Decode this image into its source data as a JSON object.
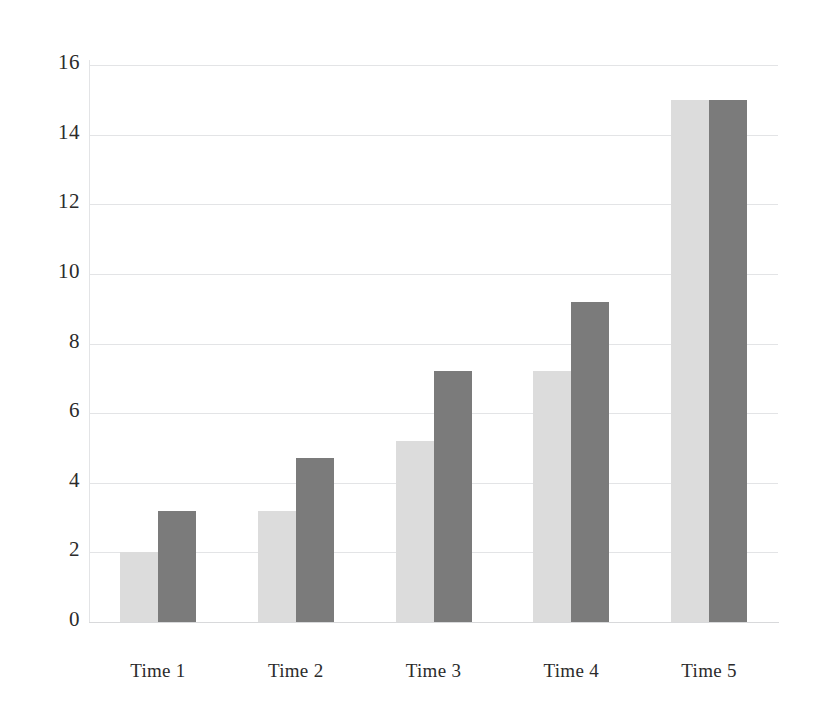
{
  "chart_data": {
    "type": "bar",
    "title": "",
    "subtitle": "",
    "xlabel": "",
    "ylabel": "",
    "categories": [
      "Time 1",
      "Time 2",
      "Time 3",
      "Time 4",
      "Time 5"
    ],
    "series": [
      {
        "name": "Series 1",
        "color": "#dcdcdc",
        "values": [
          2.0,
          3.2,
          5.2,
          7.2,
          15.0
        ]
      },
      {
        "name": "Series 2",
        "color": "#7b7b7b",
        "values": [
          3.2,
          4.7,
          7.2,
          9.2,
          15.0
        ]
      }
    ],
    "ylim": [
      0,
      16
    ],
    "ytick_values": [
      0,
      2,
      4,
      6,
      8,
      10,
      12,
      14,
      16
    ],
    "ytick_labels": [
      "0",
      "2",
      "4",
      "6",
      "8",
      "10",
      "12",
      "14",
      "16"
    ],
    "grid": "horizontal",
    "grid_color": "#e3e4e6",
    "legend": "none",
    "background": "#ffffff",
    "bar_grouping": "grouped",
    "orientation": "vertical"
  }
}
